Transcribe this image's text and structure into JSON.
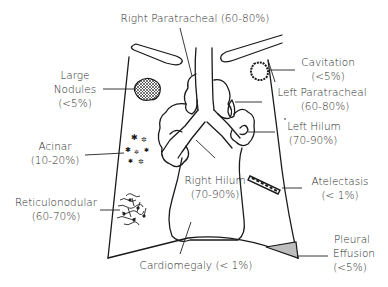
{
  "diagram": {
    "type": "chest-radiograph-findings-illustration",
    "labels": {
      "right_paratracheal": {
        "name": "Right Paratracheal",
        "pct": "(60-80%)"
      },
      "cavitation": {
        "name": "Cavitation",
        "pct": "(<5%)"
      },
      "large_nodules": {
        "name1": "Large",
        "name2": "Nodules",
        "pct": "(<5%)"
      },
      "left_paratracheal": {
        "name": "Left Paratracheal",
        "pct": "(60-80%)"
      },
      "left_hilum": {
        "name": "Left Hilum",
        "pct": "(70-90%)"
      },
      "acinar": {
        "name": "Acinar",
        "pct": "(10-20%)"
      },
      "atelectasis": {
        "name": "Atelectasis",
        "pct": "(< 1%)"
      },
      "right_hilum": {
        "name": "Right Hilum",
        "pct": "(70-90%)"
      },
      "reticulonodular": {
        "name": "Reticulonodular",
        "pct": "(60-70%)"
      },
      "pleural_effusion": {
        "name1": "Pleural",
        "name2": "Effusion",
        "pct": "(<5%)"
      },
      "cardiomegaly": {
        "name": "Cardiomegaly (< 1%)"
      }
    },
    "colors": {
      "line": "#1a1a1a",
      "text": "#2a2a2a",
      "effusion_fill": "#bdbdbd",
      "background": "#ffffff"
    }
  }
}
